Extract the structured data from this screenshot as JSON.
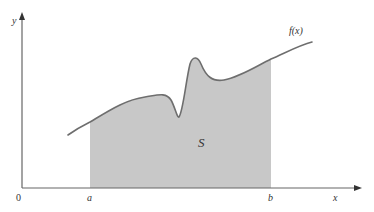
{
  "diagram": {
    "axes": {
      "x_label": "x",
      "y_label": "y",
      "origin_label": "0"
    },
    "curve": {
      "label": "f(x)",
      "stroke_color": "#6e6e6e"
    },
    "region": {
      "label": "S",
      "fill_color": "#c8c8c8",
      "left_bound_label": "a",
      "right_bound_label": "b"
    },
    "colors": {
      "axis": "#666666",
      "background": "#ffffff",
      "text": "#333333"
    }
  }
}
